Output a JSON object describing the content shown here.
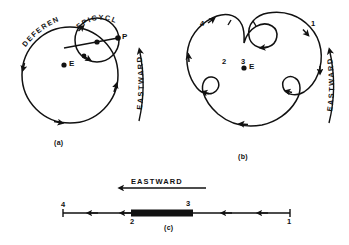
{
  "figure": {
    "line_color": "#111111",
    "background": "#ffffff"
  },
  "panel_a": {
    "caption": "(a)",
    "labels": {
      "deferent": "DEFERENT",
      "epicycle": "EPICYCLE",
      "planet": "P",
      "earth": "E",
      "eastward": "EASTWARD"
    }
  },
  "panel_b": {
    "caption": "(b)",
    "labels": {
      "earth": "E",
      "eastward": "EASTWARD"
    },
    "positions": [
      "1",
      "2",
      "3",
      "4"
    ]
  },
  "panel_c": {
    "caption": "(c)",
    "labels": {
      "eastward": "EASTWARD"
    },
    "positions": [
      "4",
      "2",
      "3",
      "1"
    ]
  }
}
